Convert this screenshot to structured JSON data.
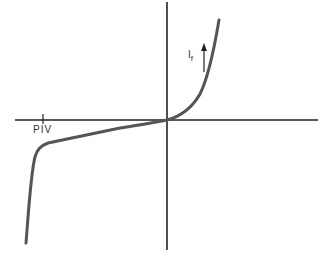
{
  "diagram": {
    "labels": {
      "piv": "PIV",
      "current_main": "I",
      "current_sub": "f"
    },
    "colors": {
      "axis": "#222222",
      "curve": "#555555",
      "text": "#333333"
    },
    "axes": {
      "horizontal": {
        "y": 120,
        "x_start": 15,
        "x_end": 318
      },
      "vertical": {
        "x": 167,
        "y_start": 2,
        "y_end": 250
      }
    },
    "piv_tick_x": 43,
    "arrow": {
      "x": 204,
      "y_top": 43,
      "y_bottom": 72,
      "direction": "up"
    },
    "curve_points": [
      [
        26,
        243
      ],
      [
        30,
        200
      ],
      [
        33,
        170
      ],
      [
        36,
        155
      ],
      [
        40,
        147
      ],
      [
        50,
        143
      ],
      [
        80,
        136
      ],
      [
        120,
        128
      ],
      [
        150,
        123
      ],
      [
        167,
        120
      ],
      [
        180,
        115
      ],
      [
        190,
        108
      ],
      [
        198,
        97
      ],
      [
        205,
        82
      ],
      [
        211,
        60
      ],
      [
        216,
        38
      ],
      [
        219,
        20
      ]
    ]
  }
}
